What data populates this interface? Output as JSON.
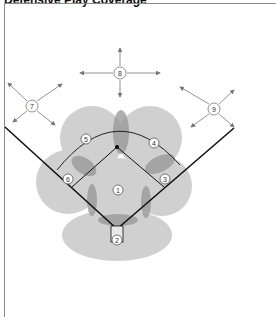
{
  "title": "Defensive Play Coverage",
  "colors": {
    "zone_fill": "#c8c8c8",
    "overlap_fill": "#9a9a9a",
    "line": "#111111",
    "arrow": "#777777",
    "frame": "#8a8a8a"
  },
  "positions": [
    {
      "number": "1",
      "name": "pitcher",
      "x": 118,
      "y": 190
    },
    {
      "number": "2",
      "name": "catcher",
      "x": 117,
      "y": 240
    },
    {
      "number": "3",
      "name": "first-base",
      "x": 165,
      "y": 179
    },
    {
      "number": "4",
      "name": "second-base",
      "x": 154,
      "y": 143
    },
    {
      "number": "5",
      "name": "shortstop",
      "x": 86,
      "y": 139
    },
    {
      "number": "6",
      "name": "third-base",
      "x": 68,
      "y": 179
    },
    {
      "number": "7",
      "name": "left-field",
      "x": 32,
      "y": 106
    },
    {
      "number": "8",
      "name": "center-field",
      "x": 120,
      "y": 73
    },
    {
      "number": "9",
      "name": "right-field",
      "x": 214,
      "y": 109
    }
  ]
}
